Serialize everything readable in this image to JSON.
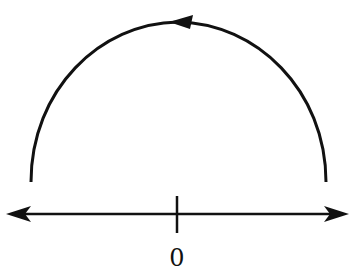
{
  "diagram": {
    "number_line": {
      "origin_label": "0",
      "arrows": [
        "left",
        "right"
      ]
    },
    "arc": {
      "shape": "semicircle",
      "direction": "counterclockwise",
      "arrowhead_position": "top"
    },
    "colors": {
      "stroke": "#111111",
      "background": "#ffffff"
    }
  }
}
